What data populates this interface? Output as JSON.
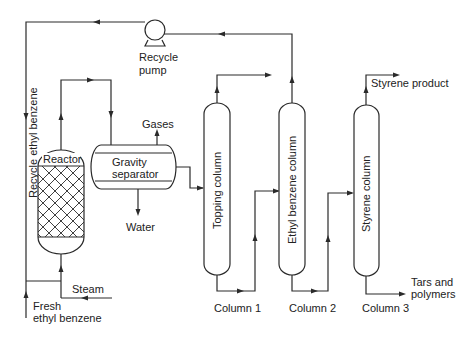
{
  "diagram": {
    "equipment": {
      "reactor": "Reactor",
      "gravity_separator_line1": "Gravity",
      "gravity_separator_line2": "separator",
      "recycle_pump_line1": "Recycle",
      "recycle_pump_line2": "pump",
      "topping_column": "Topping column",
      "ethyl_benzene_column": "Ethyl benzene column",
      "styrene_column": "Styrene column"
    },
    "column_labels": [
      "Column 1",
      "Column 2",
      "Column 3"
    ],
    "streams": {
      "recycle_ethyl_benzene": "Recycle ethyl benzene",
      "gases": "Gases",
      "water": "Water",
      "steam": "Steam",
      "fresh_line1": "Fresh",
      "fresh_line2": "ethyl benzene",
      "styrene_product": "Styrene product",
      "tars_line1": "Tars and",
      "tars_line2": "polymers"
    },
    "colors": {
      "line": "#2a2a2a",
      "text": "#222222",
      "background": "#ffffff"
    }
  }
}
